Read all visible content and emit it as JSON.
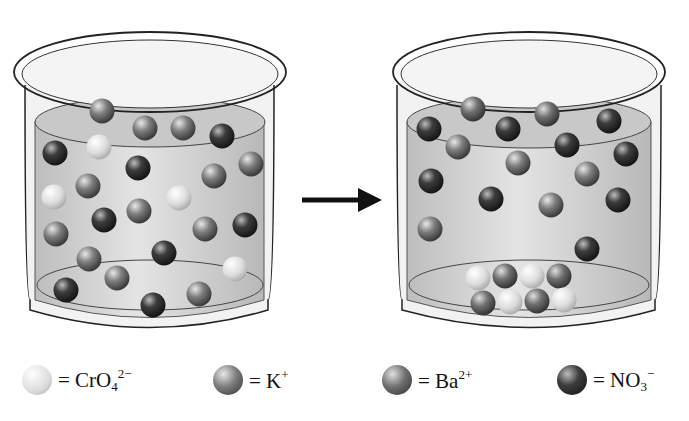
{
  "diagram": {
    "arrow": {
      "direction": "right",
      "meaning": "reaction proceeds"
    },
    "colors": {
      "chromate": "#d9d9d9",
      "potassium": "#7a7a7a",
      "barium": "#6e6e6e",
      "nitrate": "#3a3a3a",
      "liquid": "#c9c9c9",
      "glass_outline": "#222222"
    },
    "beakers": [
      {
        "name": "before",
        "balls": [
          {
            "ion": "potassium",
            "x": 102,
            "y": 111
          },
          {
            "ion": "potassium",
            "x": 145,
            "y": 128
          },
          {
            "ion": "potassium",
            "x": 183,
            "y": 128
          },
          {
            "ion": "nitrate",
            "x": 222,
            "y": 136
          },
          {
            "ion": "nitrate",
            "x": 55,
            "y": 153
          },
          {
            "ion": "chromate",
            "x": 99,
            "y": 147
          },
          {
            "ion": "nitrate",
            "x": 138,
            "y": 168
          },
          {
            "ion": "potassium",
            "x": 214,
            "y": 176
          },
          {
            "ion": "potassium",
            "x": 251,
            "y": 164
          },
          {
            "ion": "chromate",
            "x": 54,
            "y": 197
          },
          {
            "ion": "potassium",
            "x": 88,
            "y": 186
          },
          {
            "ion": "chromate",
            "x": 179,
            "y": 198
          },
          {
            "ion": "nitrate",
            "x": 104,
            "y": 220
          },
          {
            "ion": "potassium",
            "x": 139,
            "y": 211
          },
          {
            "ion": "potassium",
            "x": 205,
            "y": 229
          },
          {
            "ion": "nitrate",
            "x": 245,
            "y": 225
          },
          {
            "ion": "potassium",
            "x": 56,
            "y": 234
          },
          {
            "ion": "potassium",
            "x": 89,
            "y": 259
          },
          {
            "ion": "nitrate",
            "x": 164,
            "y": 253
          },
          {
            "ion": "chromate",
            "x": 235,
            "y": 269
          },
          {
            "ion": "potassium",
            "x": 117,
            "y": 278
          },
          {
            "ion": "nitrate",
            "x": 66,
            "y": 290
          },
          {
            "ion": "potassium",
            "x": 199,
            "y": 294
          },
          {
            "ion": "nitrate",
            "x": 153,
            "y": 305
          }
        ]
      },
      {
        "name": "after",
        "balls": [
          {
            "ion": "barium",
            "x": 473,
            "y": 109
          },
          {
            "ion": "barium",
            "x": 547,
            "y": 114
          },
          {
            "ion": "nitrate",
            "x": 429,
            "y": 129
          },
          {
            "ion": "nitrate",
            "x": 508,
            "y": 129
          },
          {
            "ion": "nitrate",
            "x": 609,
            "y": 121
          },
          {
            "ion": "potassium",
            "x": 458,
            "y": 147
          },
          {
            "ion": "nitrate",
            "x": 567,
            "y": 145
          },
          {
            "ion": "potassium",
            "x": 518,
            "y": 163
          },
          {
            "ion": "nitrate",
            "x": 626,
            "y": 154
          },
          {
            "ion": "nitrate",
            "x": 431,
            "y": 181
          },
          {
            "ion": "potassium",
            "x": 587,
            "y": 174
          },
          {
            "ion": "nitrate",
            "x": 491,
            "y": 199
          },
          {
            "ion": "potassium",
            "x": 551,
            "y": 205
          },
          {
            "ion": "nitrate",
            "x": 618,
            "y": 200
          },
          {
            "ion": "potassium",
            "x": 430,
            "y": 229
          },
          {
            "ion": "nitrate",
            "x": 587,
            "y": 249
          },
          {
            "ion": "chromate",
            "x": 478,
            "y": 278
          },
          {
            "ion": "barium",
            "x": 505,
            "y": 276
          },
          {
            "ion": "chromate",
            "x": 532,
            "y": 276
          },
          {
            "ion": "barium",
            "x": 559,
            "y": 276
          },
          {
            "ion": "barium",
            "x": 483,
            "y": 303
          },
          {
            "ion": "chromate",
            "x": 510,
            "y": 302
          },
          {
            "ion": "barium",
            "x": 537,
            "y": 301
          },
          {
            "ion": "chromate",
            "x": 564,
            "y": 300
          }
        ]
      }
    ]
  },
  "legend": [
    {
      "ion": "chromate",
      "eq": "= ",
      "base": "CrO",
      "sub": "4",
      "sup": "2−",
      "x": 22
    },
    {
      "ion": "potassium",
      "eq": "= ",
      "base": "K",
      "sub": "",
      "sup": "+",
      "x": 213
    },
    {
      "ion": "barium",
      "eq": "= ",
      "base": "Ba",
      "sub": "",
      "sup": "2+",
      "x": 382
    },
    {
      "ion": "nitrate",
      "eq": "= ",
      "base": "NO",
      "sub": "3",
      "sup": "−",
      "x": 557
    }
  ]
}
